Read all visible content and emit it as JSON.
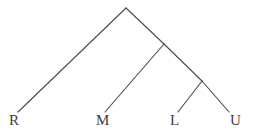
{
  "figure": {
    "name": "cladogram",
    "background_color": "#ffffff",
    "line_color": "#4a4a4a",
    "label_color": "#3d3d3d",
    "width": 261,
    "height": 136
  },
  "chart_data": {
    "type": "diagram",
    "diagram_type": "cladogram",
    "title": "",
    "xlabel": "",
    "ylabel": "",
    "grid": false,
    "legend": null,
    "taxa": [
      {
        "id": "R",
        "label": "R",
        "tip_x": 18,
        "tip_y": 112,
        "label_x": 9,
        "label_y": 113
      },
      {
        "id": "M",
        "label": "M",
        "tip_x": 105,
        "tip_y": 112,
        "label_x": 96,
        "label_y": 113
      },
      {
        "id": "L",
        "label": "L",
        "tip_x": 178,
        "tip_y": 112,
        "label_x": 170,
        "label_y": 113
      },
      {
        "id": "U",
        "label": "U",
        "tip_x": 229,
        "tip_y": 112,
        "label_x": 230,
        "label_y": 113
      }
    ],
    "nodes": [
      {
        "id": "root",
        "x": 126,
        "y": 8,
        "children": [
          "R",
          "node2"
        ]
      },
      {
        "id": "node2",
        "x": 164,
        "y": 44,
        "children": [
          "M",
          "node3"
        ]
      },
      {
        "id": "node3",
        "x": 202,
        "y": 81,
        "children": [
          "L",
          "U"
        ]
      }
    ],
    "branches": [
      {
        "name": "root-to-R",
        "x1": 126,
        "y1": 8,
        "x2": 18,
        "y2": 112
      },
      {
        "name": "root-to-node2",
        "x1": 126,
        "y1": 8,
        "x2": 164,
        "y2": 44
      },
      {
        "name": "node2-to-M",
        "x1": 164,
        "y1": 44,
        "x2": 105,
        "y2": 112
      },
      {
        "name": "node2-to-node3",
        "x1": 164,
        "y1": 44,
        "x2": 202,
        "y2": 81
      },
      {
        "name": "node3-to-L",
        "x1": 202,
        "y1": 81,
        "x2": 178,
        "y2": 112
      },
      {
        "name": "node3-to-U",
        "x1": 202,
        "y1": 81,
        "x2": 229,
        "y2": 112
      }
    ],
    "newick": "(R,(M,(L,U)));"
  }
}
